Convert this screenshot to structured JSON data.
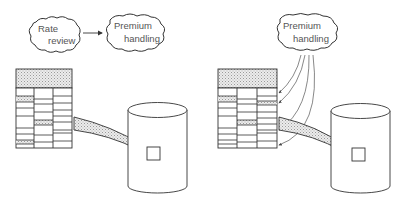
{
  "left_panel": {
    "cloud_1": {
      "line1": "Rate",
      "line2": "review"
    },
    "cloud_2": {
      "line1": "Premium",
      "line2": "handling"
    },
    "table": {
      "columns": 3,
      "header": "stippled"
    },
    "database": {
      "shape": "cylinder"
    }
  },
  "right_panel": {
    "cloud": {
      "line1": "Premium",
      "line2": "handling"
    },
    "table": {
      "columns": 3,
      "header": "stippled"
    },
    "database": {
      "shape": "cylinder"
    },
    "arrow_count": 4
  },
  "colors": {
    "line": "#333333",
    "text": "#555555",
    "stipple": "#d9d9d9"
  }
}
